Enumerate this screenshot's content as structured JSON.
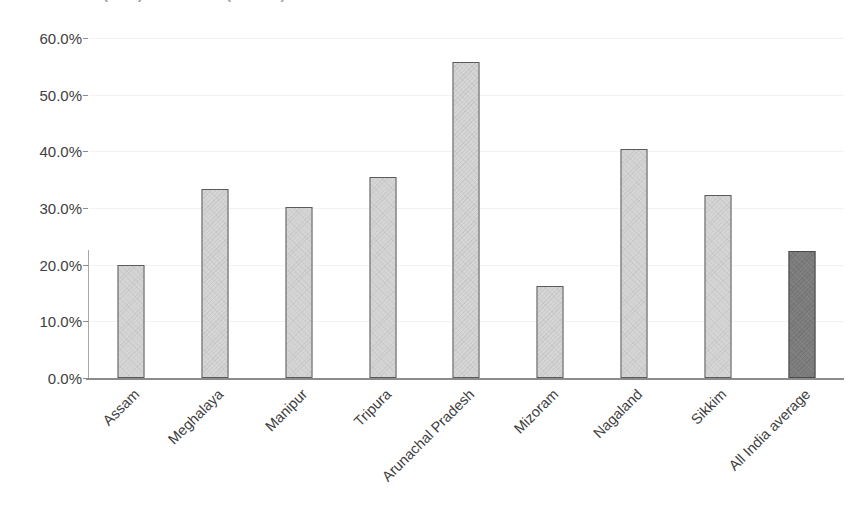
{
  "title": {
    "partial_text": "Source: ISS (2020) and NFHS-5 (2019-21)"
  },
  "chart_data": {
    "type": "bar",
    "title": "",
    "xlabel": "",
    "ylabel": "",
    "ylim": [
      0,
      60
    ],
    "ytick_labels": [
      "60.0%",
      "50.0%",
      "40.0%",
      "30.0%",
      "20.0%",
      "10.0%",
      "0.0%"
    ],
    "ytick_values": [
      60,
      50,
      40,
      30,
      20,
      10,
      0
    ],
    "grid": true,
    "legend": "none",
    "categories": [
      "Assam",
      "Meghalaya",
      "Manipur",
      "Tripura",
      "Arunachal Pradesh",
      "Mizoram",
      "Nagaland",
      "Sikkim",
      "All India average"
    ],
    "values": [
      20.0,
      33.3,
      30.2,
      35.5,
      55.7,
      16.2,
      40.5,
      32.3,
      22.4
    ],
    "value_labels": [
      "20.0%",
      "33.3%",
      "30.2%",
      "35.5%",
      "55.7%",
      "16.2%",
      "40.5%",
      "32.3%",
      "22.4%"
    ],
    "bar_colors": [
      "#d6d6d6",
      "#d6d6d6",
      "#d6d6d6",
      "#d6d6d6",
      "#d6d6d6",
      "#d6d6d6",
      "#d6d6d6",
      "#d6d6d6",
      "#7d7d7d"
    ],
    "highlight_index": 8,
    "bar_border_color": "#5a5a5a",
    "gridline_color": "#f2f2f2",
    "axis_color": "#8c8c8c",
    "text_color": "#3d3d3d"
  }
}
